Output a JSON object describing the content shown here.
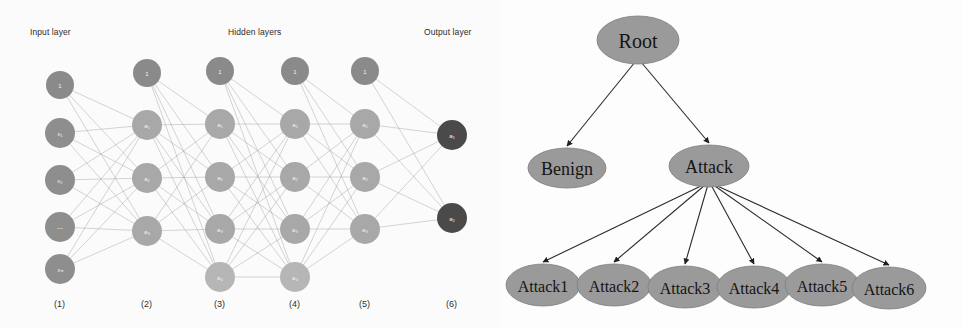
{
  "figure": {
    "panels": [
      "neural-network-architecture",
      "attack-taxonomy-tree"
    ],
    "background_color": "#fdfdfd"
  },
  "neural_network": {
    "headers": {
      "input": "Input layer",
      "hidden": "Hidden layers",
      "output": "Output layer"
    },
    "footers": [
      "(1)",
      "(2)",
      "(3)",
      "(4)",
      "(5)",
      "(6)"
    ],
    "colors": {
      "input_node": "#8e8e8e",
      "bias_node": "#8a8a8a",
      "hidden_node": "#a8a8a8",
      "hidden_node_light": "#b6b6b6",
      "output_node": "#4a4a4a",
      "edge": "#9a9a9a",
      "label_text": "#f2f2f2"
    },
    "layers": [
      {
        "index": 1,
        "name": "input-layer",
        "footer": "(1)",
        "x": 60,
        "nodes": [
          {
            "label": "1",
            "y": 85,
            "kind": "bias"
          },
          {
            "label": "x₁",
            "y": 133,
            "kind": "input"
          },
          {
            "label": "x₂",
            "y": 180,
            "kind": "input"
          },
          {
            "label": "⋯",
            "y": 227,
            "kind": "input"
          },
          {
            "label": "xₙ",
            "y": 269,
            "kind": "input"
          }
        ]
      },
      {
        "index": 2,
        "name": "hidden-layer-1",
        "footer": "(2)",
        "x": 147,
        "nodes": [
          {
            "label": "1",
            "y": 73,
            "kind": "bias"
          },
          {
            "label": "a₁",
            "y": 125,
            "kind": "hidden"
          },
          {
            "label": "a₂",
            "y": 178,
            "kind": "hidden"
          },
          {
            "label": "a₃",
            "y": 231,
            "kind": "hidden"
          }
        ]
      },
      {
        "index": 3,
        "name": "hidden-layer-2",
        "footer": "(3)",
        "x": 220,
        "nodes": [
          {
            "label": "1",
            "y": 71,
            "kind": "bias"
          },
          {
            "label": "a₁",
            "y": 124,
            "kind": "hidden"
          },
          {
            "label": "a₂",
            "y": 177,
            "kind": "hidden"
          },
          {
            "label": "a₃",
            "y": 229,
            "kind": "hidden"
          },
          {
            "label": "a₄",
            "y": 277,
            "kind": "hidden-light"
          }
        ]
      },
      {
        "index": 4,
        "name": "hidden-layer-3",
        "footer": "(4)",
        "x": 295,
        "nodes": [
          {
            "label": "1",
            "y": 71,
            "kind": "bias"
          },
          {
            "label": "a₁",
            "y": 124,
            "kind": "hidden"
          },
          {
            "label": "a₂",
            "y": 177,
            "kind": "hidden"
          },
          {
            "label": "a₃",
            "y": 229,
            "kind": "hidden"
          },
          {
            "label": "a₄",
            "y": 277,
            "kind": "hidden-light"
          }
        ]
      },
      {
        "index": 5,
        "name": "hidden-layer-4",
        "footer": "(5)",
        "x": 365,
        "nodes": [
          {
            "label": "1",
            "y": 71,
            "kind": "bias"
          },
          {
            "label": "a₁",
            "y": 124,
            "kind": "hidden"
          },
          {
            "label": "a₂",
            "y": 177,
            "kind": "hidden"
          },
          {
            "label": "a₃",
            "y": 229,
            "kind": "hidden"
          }
        ]
      },
      {
        "index": 6,
        "name": "output-layer",
        "footer": "(6)",
        "x": 452,
        "nodes": [
          {
            "label": "a₁",
            "y": 135,
            "kind": "output"
          },
          {
            "label": "a₂",
            "y": 218,
            "kind": "output"
          }
        ]
      }
    ],
    "header_positions": [
      {
        "key": "input",
        "x": 30,
        "y": 34
      },
      {
        "key": "hidden",
        "x": 228,
        "y": 34
      },
      {
        "key": "output",
        "x": 424,
        "y": 34
      }
    ],
    "footer_positions": [
      {
        "label": "(1)",
        "x": 54
      },
      {
        "label": "(2)",
        "x": 141
      },
      {
        "label": "(3)",
        "x": 214
      },
      {
        "label": "(4)",
        "x": 289
      },
      {
        "label": "(5)",
        "x": 359
      },
      {
        "label": "(6)",
        "x": 446
      }
    ],
    "node_radius": {
      "input": 15,
      "bias": 14,
      "hidden": 15,
      "hidden-light": 15,
      "output": 15
    }
  },
  "tree": {
    "colors": {
      "node_fill": "#9a9a9a",
      "node_stroke": "#7d7d7d",
      "edge": "#2a2a2a",
      "text": "#141414"
    },
    "nodes": [
      {
        "id": "root",
        "label": "Root",
        "cx": 138,
        "cy": 40,
        "rx": 41,
        "ry": 24,
        "font": 20
      },
      {
        "id": "benign",
        "label": "Benign",
        "cx": 67,
        "cy": 168,
        "rx": 39,
        "ry": 20,
        "font": 18
      },
      {
        "id": "attack",
        "label": "Attack",
        "cx": 209,
        "cy": 166,
        "rx": 40,
        "ry": 21,
        "font": 18
      },
      {
        "id": "attack1",
        "label": "Attack1",
        "cx": 43,
        "cy": 285,
        "rx": 37,
        "ry": 21,
        "font": 16
      },
      {
        "id": "attack2",
        "label": "Attack2",
        "cx": 114,
        "cy": 285,
        "rx": 37,
        "ry": 21,
        "font": 16
      },
      {
        "id": "attack3",
        "label": "Attack3",
        "cx": 185,
        "cy": 287,
        "rx": 37,
        "ry": 21,
        "font": 16
      },
      {
        "id": "attack4",
        "label": "Attack4",
        "cx": 254,
        "cy": 287,
        "rx": 37,
        "ry": 21,
        "font": 16
      },
      {
        "id": "attack5",
        "label": "Attack5",
        "cx": 322,
        "cy": 285,
        "rx": 37,
        "ry": 21,
        "font": 16
      },
      {
        "id": "attack6",
        "label": "Attack6",
        "cx": 389,
        "cy": 288,
        "rx": 37,
        "ry": 21,
        "font": 16
      }
    ],
    "edges": [
      {
        "from": "root",
        "to": "benign"
      },
      {
        "from": "root",
        "to": "attack"
      },
      {
        "from": "attack",
        "to": "attack1"
      },
      {
        "from": "attack",
        "to": "attack2"
      },
      {
        "from": "attack",
        "to": "attack3"
      },
      {
        "from": "attack",
        "to": "attack4"
      },
      {
        "from": "attack",
        "to": "attack5"
      },
      {
        "from": "attack",
        "to": "attack6"
      }
    ]
  }
}
